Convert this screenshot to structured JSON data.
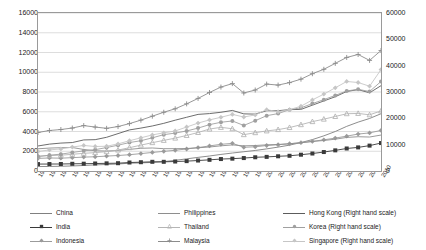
{
  "chart_data": {
    "type": "line",
    "title": "",
    "subtitle": "",
    "xlabel": "",
    "ylabel": "",
    "y2label": "",
    "grid": true,
    "legend_position": "bottom",
    "x": [
      1980,
      1981,
      1982,
      1983,
      1984,
      1985,
      1986,
      1987,
      1988,
      1989,
      1990,
      1991,
      1992,
      1993,
      1994,
      1995,
      1996,
      1997,
      1998,
      1999,
      2000,
      2001,
      2002,
      2003,
      2004,
      2005,
      2006,
      2007,
      2008,
      2009,
      2010
    ],
    "xtick_labels": [
      "1980",
      "1981",
      "1982",
      "1983",
      "1984",
      "1985",
      "1986",
      "1987",
      "1988",
      "1989",
      "1990",
      "1991",
      "1992",
      "1993",
      "1994",
      "1995",
      "1996",
      "1997",
      "1998",
      "1999",
      "2000",
      "2001",
      "2002",
      "2003",
      "2004",
      "2005",
      "2006",
      "2007",
      "2008",
      "2009",
      "2010"
    ],
    "ylim": [
      0,
      16000
    ],
    "ytick_labels": [
      "0",
      "2000",
      "4000",
      "6000",
      "8000",
      "10000",
      "12000",
      "14000",
      "16000"
    ],
    "yticks": [
      0,
      2000,
      4000,
      6000,
      8000,
      10000,
      12000,
      14000,
      16000
    ],
    "y2lim": [
      0,
      60000
    ],
    "y2tick_labels": [
      "0",
      "10000",
      "20000",
      "30000",
      "40000",
      "50000",
      "60000"
    ],
    "y2ticks": [
      0,
      10000,
      20000,
      30000,
      40000,
      50000,
      60000
    ],
    "series": [
      {
        "name": "China",
        "axis": "left",
        "color": "#808080",
        "marker": "none",
        "values": [
          450,
          460,
          480,
          510,
          560,
          620,
          660,
          710,
          790,
          820,
          870,
          950,
          1080,
          1230,
          1380,
          1520,
          1680,
          1820,
          1950,
          2080,
          2240,
          2420,
          2620,
          2880,
          3180,
          3560,
          4000,
          4520,
          4950,
          5320,
          5800
        ]
      },
      {
        "name": "India",
        "axis": "left",
        "color": "#3a3a3a",
        "marker": "square",
        "values": [
          700,
          705,
          710,
          730,
          740,
          760,
          775,
          790,
          860,
          890,
          930,
          930,
          960,
          1000,
          1060,
          1130,
          1210,
          1250,
          1310,
          1390,
          1430,
          1490,
          1540,
          1650,
          1770,
          1920,
          2090,
          2280,
          2390,
          2570,
          2830
        ]
      },
      {
        "name": "Indonesia",
        "axis": "left",
        "color": "#9b9b9b",
        "marker": "diamond",
        "values": [
          1280,
          1320,
          1300,
          1350,
          1410,
          1440,
          1510,
          1570,
          1650,
          1760,
          1880,
          1990,
          2100,
          2230,
          2370,
          2540,
          2700,
          2800,
          2400,
          2450,
          2580,
          2660,
          2760,
          2870,
          3000,
          3160,
          3330,
          3530,
          3740,
          3860,
          4110
        ]
      },
      {
        "name": "Philippines",
        "axis": "left",
        "color": "#8e8e8e",
        "marker": "none",
        "values": [
          2250,
          2320,
          2360,
          2380,
          2180,
          2050,
          2020,
          2080,
          2190,
          2300,
          2330,
          2260,
          2260,
          2280,
          2350,
          2430,
          2550,
          2640,
          2550,
          2580,
          2650,
          2690,
          2760,
          2860,
          2990,
          3090,
          3220,
          3400,
          3470,
          3440,
          3640
        ]
      },
      {
        "name": "Thailand",
        "axis": "left",
        "color": "#b5b5b5",
        "marker": "triangle",
        "values": [
          1500,
          1560,
          1600,
          1690,
          1790,
          1860,
          1960,
          2120,
          2360,
          2620,
          2870,
          3100,
          3330,
          3600,
          3900,
          4250,
          4420,
          4280,
          3680,
          3880,
          4060,
          4190,
          4400,
          4690,
          5000,
          5250,
          5520,
          5800,
          5830,
          5690,
          6080
        ]
      },
      {
        "name": "Malaysia",
        "axis": "left",
        "color": "#8c8c8c",
        "marker": "cross",
        "values": [
          3900,
          4100,
          4200,
          4350,
          4600,
          4450,
          4320,
          4500,
          4800,
          5150,
          5550,
          5950,
          6300,
          6800,
          7350,
          7950,
          8500,
          8850,
          7900,
          8200,
          8800,
          8700,
          8950,
          9300,
          9850,
          10300,
          10900,
          11500,
          11800,
          11200,
          12200
        ]
      },
      {
        "name": "Hong Kong (Right hand scale)",
        "axis": "right",
        "color": "#5c5c5c",
        "marker": "none",
        "values": [
          9500,
          10200,
          10600,
          10800,
          11800,
          11900,
          12800,
          14200,
          15600,
          16300,
          17100,
          18100,
          19300,
          20400,
          21500,
          21800,
          22300,
          23000,
          21700,
          21600,
          22900,
          22900,
          23300,
          23400,
          25000,
          26600,
          28200,
          30200,
          30900,
          29700,
          32400
        ]
      },
      {
        "name": "Korea (Right hand scale)",
        "axis": "right",
        "color": "#a0a0a0",
        "marker": "circle",
        "values": [
          5500,
          6000,
          6400,
          7050,
          7650,
          8100,
          8900,
          9800,
          10800,
          11500,
          12600,
          13800,
          14400,
          15200,
          16300,
          17600,
          18500,
          19000,
          17300,
          19100,
          21000,
          21800,
          23300,
          24000,
          25600,
          27100,
          28700,
          30400,
          31000,
          30200,
          34000
        ]
      },
      {
        "name": "Singapore (Right hand scale)",
        "axis": "right",
        "color": "#c6c6c6",
        "marker": "diamond",
        "values": [
          7400,
          8000,
          8400,
          9100,
          9700,
          9300,
          9400,
          10300,
          11500,
          12600,
          13700,
          14500,
          15200,
          16700,
          18200,
          19400,
          20400,
          21500,
          20500,
          21300,
          23300,
          22500,
          23300,
          24600,
          27000,
          29200,
          31600,
          34000,
          33600,
          32200,
          38500
        ]
      }
    ]
  },
  "axes": {
    "left_ticks": [
      "16000",
      "14000",
      "12000",
      "10000",
      "8000",
      "6000",
      "4000",
      "2000",
      "0"
    ],
    "right_ticks": [
      "60000",
      "50000",
      "40000",
      "30000",
      "20000",
      "10000",
      "0"
    ]
  },
  "legend": {
    "items": [
      {
        "label": "China",
        "color": "#808080",
        "marker": "none"
      },
      {
        "label": "India",
        "color": "#3a3a3a",
        "marker": "square"
      },
      {
        "label": "Indonesia",
        "color": "#9b9b9b",
        "marker": "diamond"
      },
      {
        "label": "Philippines",
        "color": "#8e8e8e",
        "marker": "none"
      },
      {
        "label": "Thailand",
        "color": "#b5b5b5",
        "marker": "triangle"
      },
      {
        "label": "Malaysia",
        "color": "#8c8c8c",
        "marker": "cross"
      },
      {
        "label": "Hong Kong (Right hand scale)",
        "color": "#5c5c5c",
        "marker": "none"
      },
      {
        "label": "Korea (Right hand scale)",
        "color": "#a0a0a0",
        "marker": "circle"
      },
      {
        "label": "Singapore (Right hand scale)",
        "color": "#c6c6c6",
        "marker": "diamond"
      }
    ]
  }
}
